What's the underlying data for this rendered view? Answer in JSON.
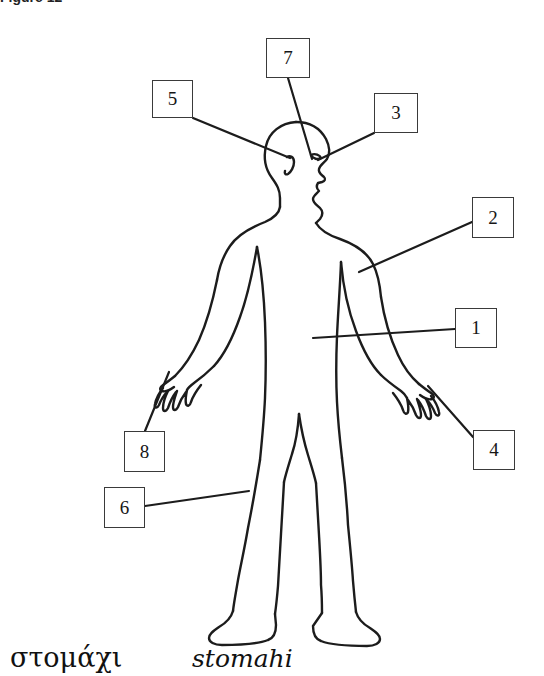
{
  "figure": {
    "caption_fragment": "Figure 12",
    "alt_title": "human body outline with numbered callouts"
  },
  "callouts": [
    {
      "id": "callout-1",
      "label": "1",
      "x": 455,
      "y": 308,
      "w": 42,
      "h": 40,
      "leader": {
        "x1": 455,
        "y1": 329,
        "x2": 313,
        "y2": 338
      }
    },
    {
      "id": "callout-2",
      "label": "2",
      "x": 472,
      "y": 197,
      "w": 42,
      "h": 41,
      "leader": {
        "x1": 472,
        "y1": 222,
        "x2": 359,
        "y2": 272
      }
    },
    {
      "id": "callout-3",
      "label": "3",
      "x": 374,
      "y": 93,
      "w": 44,
      "h": 40,
      "leader": {
        "x1": 374,
        "y1": 133,
        "x2": 318,
        "y2": 160
      }
    },
    {
      "id": "callout-4",
      "label": "4",
      "x": 473,
      "y": 430,
      "w": 42,
      "h": 40,
      "leader": {
        "x1": 473,
        "y1": 437,
        "x2": 428,
        "y2": 386
      }
    },
    {
      "id": "callout-5",
      "label": "5",
      "x": 152,
      "y": 80,
      "w": 41,
      "h": 38,
      "leader": {
        "x1": 193,
        "y1": 118,
        "x2": 287,
        "y2": 157
      }
    },
    {
      "id": "callout-6",
      "label": "6",
      "x": 104,
      "y": 487,
      "w": 41,
      "h": 41,
      "leader": {
        "x1": 145,
        "y1": 506,
        "x2": 249,
        "y2": 491
      }
    },
    {
      "id": "callout-7",
      "label": "7",
      "x": 266,
      "y": 38,
      "w": 44,
      "h": 40,
      "leader": {
        "x1": 288,
        "y1": 78,
        "x2": 312,
        "y2": 158
      }
    },
    {
      "id": "callout-8",
      "label": "8",
      "x": 124,
      "y": 431,
      "w": 41,
      "h": 41,
      "leader": {
        "x1": 145,
        "y1": 431,
        "x2": 170,
        "y2": 372
      }
    }
  ],
  "vocabulary": {
    "greek": "στομάχι",
    "transliteration": "stomahi"
  },
  "colors": {
    "line": "#1c1c1c",
    "box_border": "#3a3a3a",
    "background": "#ffffff",
    "text": "#111111"
  }
}
